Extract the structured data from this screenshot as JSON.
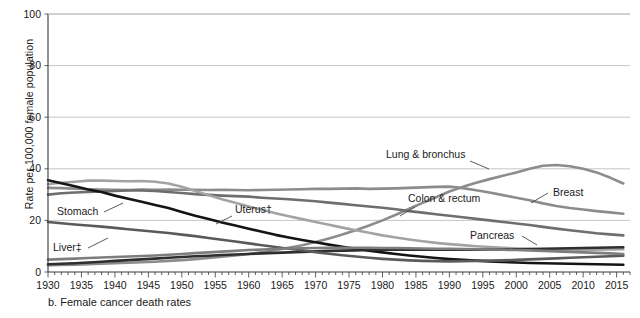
{
  "caption": "b. Female cancer death rates",
  "axis": {
    "ylabel": "Rate per 100,000 female population",
    "yticks": [
      "0",
      "20",
      "40",
      "60",
      "80",
      "100"
    ],
    "ytickvalues": [
      0,
      20,
      40,
      60,
      80,
      100
    ],
    "xticks": [
      "1930",
      "1935",
      "1940",
      "1945",
      "1950",
      "1955",
      "1960",
      "1965",
      "1970",
      "1975",
      "1980",
      "1985",
      "1990",
      "1995",
      "2000",
      "2005",
      "2010",
      "2015"
    ],
    "xtickvalues": [
      1930,
      1935,
      1940,
      1945,
      1950,
      1955,
      1960,
      1965,
      1970,
      1975,
      1980,
      1985,
      1990,
      1995,
      2000,
      2005,
      2010,
      2015
    ]
  },
  "colors": {
    "lung": "#8c8c8c",
    "breast": "#8c8c8c",
    "colon": "#6e6e6e",
    "uterus": "#a3a3a3",
    "stomach": "#141414",
    "pancreas": "#2e2e2e",
    "liver": "#5a5a5a",
    "ovary": "#7d7d7d",
    "grid": "#b8b8b8",
    "axis": "#3a3a3a",
    "text": "#1a1a1a",
    "background": "#ffffff"
  },
  "labels": [
    {
      "id": "lung",
      "text": "Lung & bronchus",
      "x": 386,
      "y": 158,
      "anchor": "start",
      "leader": [
        [
          470,
          161
        ],
        [
          489,
          169
        ]
      ]
    },
    {
      "id": "breast",
      "text": "Breast",
      "x": 553,
      "y": 196,
      "anchor": "start",
      "leader": [
        [
          548,
          193
        ],
        [
          531,
          203
        ]
      ]
    },
    {
      "id": "colon",
      "text": "Colon & rectum",
      "x": 408,
      "y": 202,
      "anchor": "start",
      "leader": [
        [
          415,
          207
        ],
        [
          400,
          216
        ]
      ]
    },
    {
      "id": "pancreas",
      "text": "Pancreas",
      "x": 470,
      "y": 239,
      "anchor": "start",
      "leader": [
        [
          522,
          236
        ],
        [
          537,
          245
        ]
      ]
    },
    {
      "id": "uterus",
      "text": "Uterus†",
      "x": 235,
      "y": 213,
      "anchor": "start",
      "leader": [
        [
          232,
          216
        ],
        [
          216,
          224
        ]
      ]
    },
    {
      "id": "stomach",
      "text": "Stomach",
      "x": 57,
      "y": 215,
      "anchor": "start",
      "leader": [
        [
          104,
          212
        ],
        [
          123,
          203
        ]
      ]
    },
    {
      "id": "liver",
      "text": "Liver‡",
      "x": 53,
      "y": 251,
      "anchor": "start",
      "leader": [
        [
          88,
          248
        ],
        [
          108,
          238
        ]
      ]
    }
  ],
  "chart_data": {
    "type": "line",
    "title": "b. Female cancer death rates",
    "xlabel": "",
    "ylabel": "Rate per 100,000 female population",
    "xlim": [
      1930,
      2017
    ],
    "ylim": [
      0,
      100
    ],
    "grid": true,
    "legend": "inline-annotations",
    "x": [
      1930,
      1932,
      1934,
      1936,
      1938,
      1940,
      1942,
      1944,
      1946,
      1948,
      1950,
      1952,
      1954,
      1956,
      1958,
      1960,
      1962,
      1964,
      1966,
      1968,
      1970,
      1972,
      1974,
      1976,
      1978,
      1980,
      1982,
      1984,
      1986,
      1988,
      1990,
      1992,
      1994,
      1996,
      1998,
      2000,
      2002,
      2004,
      2006,
      2008,
      2010,
      2012,
      2014,
      2016
    ],
    "series": [
      {
        "name": "Lung & bronchus",
        "color": "#8c8c8c",
        "values": [
          2.6,
          2.7,
          2.8,
          3.0,
          3.2,
          3.4,
          3.6,
          3.8,
          4.0,
          4.3,
          4.6,
          5.0,
          5.4,
          5.9,
          6.4,
          7.0,
          7.7,
          8.5,
          9.4,
          10.4,
          11.6,
          13.0,
          14.5,
          16.2,
          18.0,
          20.0,
          22.2,
          24.5,
          26.8,
          29.0,
          31.2,
          33.0,
          34.6,
          36.0,
          37.3,
          38.6,
          40.0,
          41.2,
          41.5,
          41.0,
          40.0,
          38.6,
          36.6,
          34.3
        ]
      },
      {
        "name": "Breast",
        "color": "#8c8c8c",
        "values": [
          32.6,
          32.5,
          32.3,
          32.1,
          32.0,
          31.9,
          31.8,
          32.0,
          31.9,
          32.0,
          31.9,
          31.9,
          31.8,
          31.9,
          31.8,
          31.7,
          31.8,
          31.9,
          32.0,
          32.1,
          32.2,
          32.2,
          32.3,
          32.4,
          32.2,
          32.3,
          32.4,
          32.6,
          32.8,
          33.0,
          33.1,
          32.5,
          31.7,
          30.8,
          29.8,
          28.8,
          27.8,
          26.6,
          25.6,
          24.8,
          24.2,
          23.6,
          23.1,
          22.6
        ]
      },
      {
        "name": "Colon & rectum",
        "color": "#6e6e6e",
        "values": [
          30.0,
          30.5,
          30.8,
          31.0,
          31.2,
          31.4,
          31.6,
          31.6,
          31.4,
          31.0,
          30.6,
          30.2,
          29.9,
          29.6,
          29.4,
          29.2,
          28.8,
          28.5,
          28.2,
          27.8,
          27.4,
          26.9,
          26.4,
          25.9,
          25.4,
          24.9,
          24.3,
          23.6,
          23.0,
          22.4,
          21.8,
          21.2,
          20.6,
          20.0,
          19.4,
          18.8,
          18.2,
          17.5,
          16.8,
          16.2,
          15.6,
          15.0,
          14.6,
          14.2
        ]
      },
      {
        "name": "Uterus",
        "color": "#a3a3a3",
        "values": [
          34.0,
          34.6,
          35.0,
          35.4,
          35.4,
          35.3,
          35.2,
          35.3,
          35.0,
          34.3,
          33.0,
          31.4,
          29.8,
          28.2,
          26.8,
          25.4,
          24.1,
          22.8,
          21.6,
          20.5,
          19.4,
          18.3,
          17.2,
          16.2,
          15.2,
          14.2,
          13.4,
          12.6,
          11.9,
          11.3,
          10.8,
          10.4,
          10.0,
          9.7,
          9.4,
          9.1,
          8.9,
          8.7,
          8.6,
          8.5,
          8.5,
          8.6,
          8.7,
          8.8
        ]
      },
      {
        "name": "Stomach",
        "color": "#141414",
        "values": [
          35.6,
          34.4,
          33.2,
          32.0,
          31.0,
          29.6,
          28.4,
          27.2,
          26.0,
          24.8,
          23.3,
          21.8,
          20.5,
          19.2,
          18.0,
          16.8,
          15.6,
          14.4,
          13.4,
          12.4,
          11.5,
          10.6,
          9.8,
          9.0,
          8.3,
          7.6,
          7.0,
          6.4,
          5.9,
          5.4,
          5.0,
          4.7,
          4.4,
          4.1,
          3.9,
          3.7,
          3.5,
          3.4,
          3.3,
          3.2,
          3.1,
          3.0,
          2.9,
          2.8
        ]
      },
      {
        "name": "Pancreas",
        "color": "#2e2e2e",
        "values": [
          3.0,
          3.2,
          3.4,
          3.7,
          4.0,
          4.3,
          4.6,
          4.9,
          5.2,
          5.5,
          5.8,
          6.1,
          6.3,
          6.6,
          6.8,
          7.0,
          7.2,
          7.4,
          7.6,
          7.8,
          8.0,
          8.2,
          8.3,
          8.4,
          8.5,
          8.6,
          8.6,
          8.6,
          8.6,
          8.6,
          8.6,
          8.6,
          8.6,
          8.7,
          8.7,
          8.8,
          8.9,
          9.0,
          9.1,
          9.2,
          9.3,
          9.4,
          9.5,
          9.6
        ]
      },
      {
        "name": "Liver",
        "color": "#5a5a5a",
        "values": [
          19.4,
          18.9,
          18.4,
          18.0,
          17.6,
          17.1,
          16.6,
          16.1,
          15.6,
          15.1,
          14.5,
          13.9,
          13.2,
          12.5,
          11.8,
          11.1,
          10.4,
          9.7,
          9.0,
          8.4,
          7.7,
          7.1,
          6.5,
          6.0,
          5.5,
          5.1,
          4.8,
          4.5,
          4.3,
          4.2,
          4.1,
          4.2,
          4.3,
          4.4,
          4.5,
          4.7,
          4.9,
          5.1,
          5.3,
          5.5,
          5.7,
          5.9,
          6.1,
          6.3
        ]
      },
      {
        "name": "Ovary",
        "color": "#7d7d7d",
        "values": [
          4.8,
          5.0,
          5.2,
          5.4,
          5.6,
          5.8,
          6.0,
          6.2,
          6.4,
          6.7,
          7.0,
          7.3,
          7.6,
          7.9,
          8.2,
          8.5,
          8.7,
          8.9,
          9.1,
          9.2,
          9.3,
          9.4,
          9.4,
          9.4,
          9.4,
          9.3,
          9.3,
          9.2,
          9.1,
          9.0,
          9.0,
          8.9,
          8.8,
          8.7,
          8.6,
          8.5,
          8.4,
          8.2,
          8.0,
          7.8,
          7.6,
          7.4,
          7.2,
          7.0
        ]
      }
    ]
  }
}
